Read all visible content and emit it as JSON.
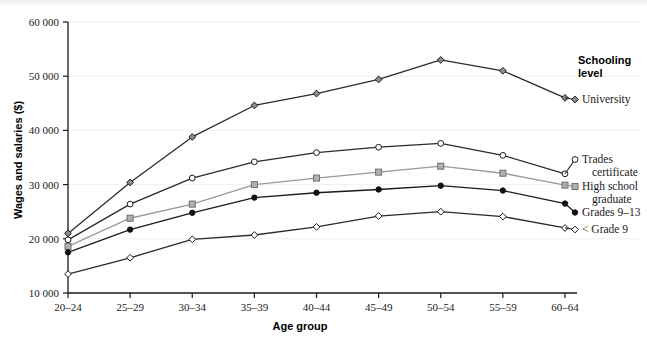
{
  "chart_data": {
    "type": "line",
    "title": "",
    "xlabel": "Age group",
    "ylabel": "Wages and salaries ($)",
    "categories": [
      "20–24",
      "25–29",
      "30–34",
      "35–39",
      "40–44",
      "45–49",
      "50–54",
      "55–59",
      "60–64"
    ],
    "ylim": [
      10000,
      60000
    ],
    "yticks": [
      10000,
      20000,
      30000,
      40000,
      50000,
      60000
    ],
    "ytick_labels": [
      "10 000",
      "20 000",
      "30 000",
      "40 000",
      "50 000",
      "60 000"
    ],
    "grid": true,
    "legend_position": "right",
    "legend_title": "Schooling level",
    "series": [
      {
        "name": "University",
        "marker": "diamond-gray",
        "color": "#2b2b2b",
        "values": [
          21000,
          30400,
          38800,
          44600,
          46800,
          49400,
          53000,
          51000,
          46000
        ]
      },
      {
        "name": "Trades certificate",
        "marker": "circle-open",
        "color": "#2b2b2b",
        "values": [
          19800,
          26400,
          31200,
          34200,
          35900,
          36900,
          37600,
          35400,
          32000
        ]
      },
      {
        "name": "High school graduate",
        "marker": "square-gray",
        "color": "#9a9a9a",
        "values": [
          18600,
          23800,
          26400,
          30000,
          31200,
          32300,
          33400,
          32100,
          29900
        ]
      },
      {
        "name": "Grades 9–13",
        "marker": "circle-filled",
        "color": "#1a1a1a",
        "values": [
          17500,
          21700,
          24800,
          27600,
          28500,
          29100,
          29800,
          28900,
          26500
        ]
      },
      {
        "name": "< Grade 9",
        "marker": "diamond-open",
        "color": "#2b2b2b",
        "values": [
          13500,
          16500,
          19900,
          20700,
          22200,
          24200,
          25000,
          24100,
          22000
        ]
      }
    ]
  },
  "legend": {
    "title_line1": "Schooling",
    "title_line2": "level",
    "items": [
      {
        "label_line1": "University",
        "label_line2": ""
      },
      {
        "label_line1": "Trades",
        "label_line2": "certificate"
      },
      {
        "label_line1": "High school",
        "label_line2": "graduate"
      },
      {
        "label_line1": "Grades 9–13",
        "label_line2": ""
      },
      {
        "label_line1": "< Grade 9",
        "label_line2": ""
      }
    ]
  }
}
